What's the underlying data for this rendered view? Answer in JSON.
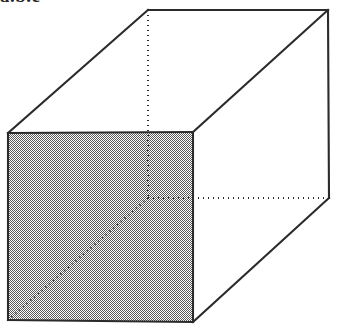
{
  "figure": {
    "kind": "line-drawing",
    "caption_fragment": "a.b.c",
    "background_color": "#ffffff",
    "stroke_color": "#2b2b2b",
    "shade_fill_color": "#a0a0a0",
    "shade_pattern": "50-percent-dither-checkerboard",
    "solid_stroke_width": 2.1,
    "dotted_stroke_width": 2.0,
    "dot_pattern": "1 4",
    "width": 338,
    "height": 326
  },
  "geometry": {
    "front_face": {
      "name": "shaded-front-face",
      "points": "8,133 193,132 193,322 8,320",
      "filled": true
    },
    "solid_edges": [
      {
        "name": "front-top-edge",
        "x1": 8,
        "y1": 133,
        "x2": 193,
        "y2": 132
      },
      {
        "name": "front-right-edge",
        "x1": 193,
        "y1": 132,
        "x2": 193,
        "y2": 322
      },
      {
        "name": "front-bottom-edge",
        "x1": 193,
        "y1": 322,
        "x2": 8,
        "y2": 320
      },
      {
        "name": "front-left-edge",
        "x1": 8,
        "y1": 320,
        "x2": 8,
        "y2": 133
      },
      {
        "name": "top-left-receding-edge",
        "x1": 8,
        "y1": 133,
        "x2": 148,
        "y2": 10
      },
      {
        "name": "back-top-edge",
        "x1": 148,
        "y1": 10,
        "x2": 328,
        "y2": 10
      },
      {
        "name": "top-right-receding-edge",
        "x1": 193,
        "y1": 132,
        "x2": 328,
        "y2": 10
      },
      {
        "name": "back-right-edge",
        "x1": 328,
        "y1": 10,
        "x2": 329,
        "y2": 198
      },
      {
        "name": "bottom-right-receding-edge",
        "x1": 193,
        "y1": 322,
        "x2": 329,
        "y2": 198
      }
    ],
    "hidden_edges": [
      {
        "name": "hidden-vertical-edge",
        "x1": 148,
        "y1": 10,
        "x2": 148,
        "y2": 198
      },
      {
        "name": "hidden-receding-edge",
        "x1": 148,
        "y1": 198,
        "x2": 329,
        "y2": 198
      },
      {
        "name": "hidden-diagonal-on-face",
        "x1": 148,
        "y1": 198,
        "x2": 8,
        "y2": 320
      }
    ]
  }
}
